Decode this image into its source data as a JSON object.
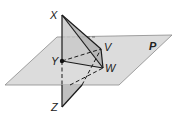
{
  "diagram": {
    "type": "geometry-3d",
    "plane": {
      "label": "P",
      "fill": "#d9d9d9",
      "stroke": "#8c8c8c"
    },
    "points": [
      {
        "label": "X",
        "x": 62,
        "y": 15
      },
      {
        "label": "Y",
        "x": 62,
        "y": 61
      },
      {
        "label": "V",
        "x": 101,
        "y": 49
      },
      {
        "label": "W",
        "x": 103,
        "y": 68
      },
      {
        "label": "Z",
        "x": 62,
        "y": 107
      }
    ],
    "labels": {
      "X": "X",
      "Y": "Y",
      "V": "V",
      "W": "W",
      "Z": "Z",
      "P": "P"
    },
    "colors": {
      "plane_fill": "#d9d9d9",
      "triangle_fill": "#bdbdbd",
      "line": "#1a1a1a"
    }
  }
}
